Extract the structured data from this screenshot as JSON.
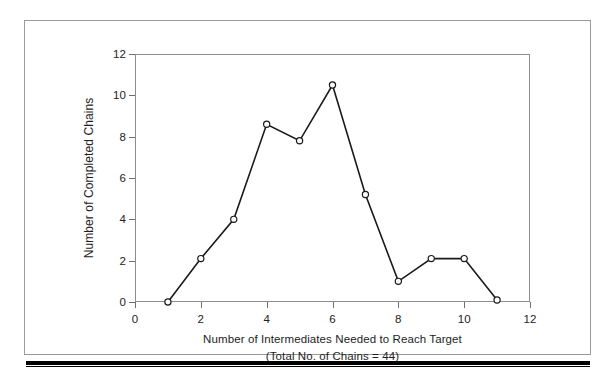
{
  "chart_data": {
    "type": "line",
    "title": "",
    "xlabel": "Number of Intermediates Needed to Reach Target",
    "sublabel": "(Total No. of Chains = 44)",
    "ylabel": "Number of Completed Chains",
    "x": [
      1,
      2,
      3,
      4,
      5,
      6,
      7,
      8,
      9,
      10,
      11
    ],
    "values": [
      0.0,
      2.1,
      4.0,
      8.6,
      7.8,
      10.5,
      5.2,
      1.0,
      2.1,
      2.1,
      0.1
    ],
    "series": [
      {
        "name": "Completed chains",
        "values": [
          0.0,
          2.1,
          4.0,
          8.6,
          7.8,
          10.5,
          5.2,
          1.0,
          2.1,
          2.1,
          0.1
        ]
      }
    ],
    "xlim": [
      0,
      12
    ],
    "ylim": [
      0,
      12
    ],
    "xticks": [
      0,
      2,
      4,
      6,
      8,
      10,
      12
    ],
    "xtick_labels": [
      "0",
      "2",
      "4",
      "6",
      "8",
      "10",
      "12"
    ],
    "yticks": [
      0,
      2,
      4,
      6,
      8,
      10,
      12
    ],
    "ytick_labels": [
      "0",
      "2",
      "4",
      "6",
      "8",
      "10",
      "12"
    ],
    "grid": false,
    "legend": false,
    "marker": "open-circle",
    "line_color": "#1a1a1a",
    "marker_fill": "#ffffff",
    "axis_color": "#8d8d8d",
    "total_chains": 44
  }
}
